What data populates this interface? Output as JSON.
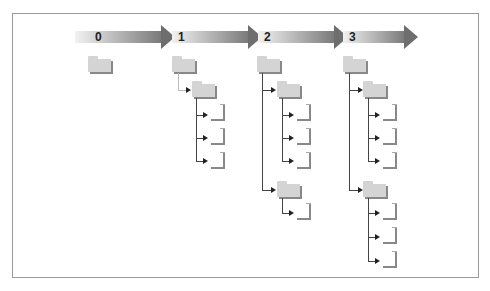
{
  "diagram": {
    "stages": [
      {
        "label": "0"
      },
      {
        "label": "1"
      },
      {
        "label": "2"
      },
      {
        "label": "3"
      }
    ],
    "colors": {
      "arrow_start": "#f2f2f2",
      "arrow_end": "#6e6e6e",
      "folder": "#d4d4d4",
      "shadow": "#888888",
      "connector": "#444444",
      "frame": "#9a9a9a"
    },
    "trees": [
      {
        "stage": "0",
        "root": "folder",
        "children": []
      },
      {
        "stage": "1",
        "root": "folder",
        "children": [
          {
            "type": "folder",
            "files": 3
          }
        ]
      },
      {
        "stage": "2",
        "root": "folder",
        "children": [
          {
            "type": "folder",
            "files": 3
          },
          {
            "type": "folder",
            "files": 1
          }
        ]
      },
      {
        "stage": "3",
        "root": "folder",
        "children": [
          {
            "type": "folder",
            "files": 3
          },
          {
            "type": "folder",
            "files": 3
          }
        ]
      }
    ]
  }
}
